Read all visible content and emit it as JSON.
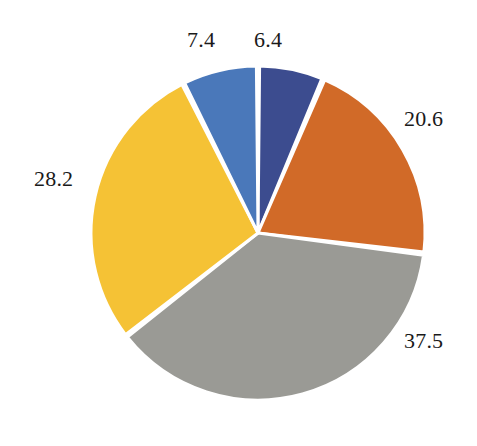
{
  "chart_data": {
    "type": "pie",
    "title": "",
    "subtitle": "",
    "xlabel": "",
    "ylabel": "",
    "grid": false,
    "legend": "none",
    "start_angle_deg": 0,
    "direction": "clockwise",
    "total": 100.1,
    "categories": [
      "6.4",
      "20.6",
      "37.5",
      "28.2",
      "7.4"
    ],
    "values": [
      6.4,
      20.6,
      37.5,
      28.2,
      7.4
    ],
    "labels": [
      "6.4",
      "20.6",
      "37.5",
      "28.2",
      "7.4"
    ],
    "colors": [
      "#3c4c8f",
      "#d16a28",
      "#9a9a95",
      "#f5c235",
      "#4a78ba"
    ],
    "slices": [
      {
        "label": "6.4",
        "value": 6.4,
        "color": "#3c4c8f",
        "label_position": "top"
      },
      {
        "label": "20.6",
        "value": 20.6,
        "color": "#d16a28",
        "label_position": "right"
      },
      {
        "label": "37.5",
        "value": 37.5,
        "color": "#9a9a95",
        "label_position": "bottom-right"
      },
      {
        "label": "28.2",
        "value": 28.2,
        "color": "#f5c235",
        "label_position": "left"
      },
      {
        "label": "7.4",
        "value": 7.4,
        "color": "#4a78ba",
        "label_position": "top-left"
      }
    ],
    "annotations": []
  },
  "figure": {
    "background_color": "#ffffff",
    "separator_color": "#ffffff",
    "label_color": "#1a1a1a"
  }
}
